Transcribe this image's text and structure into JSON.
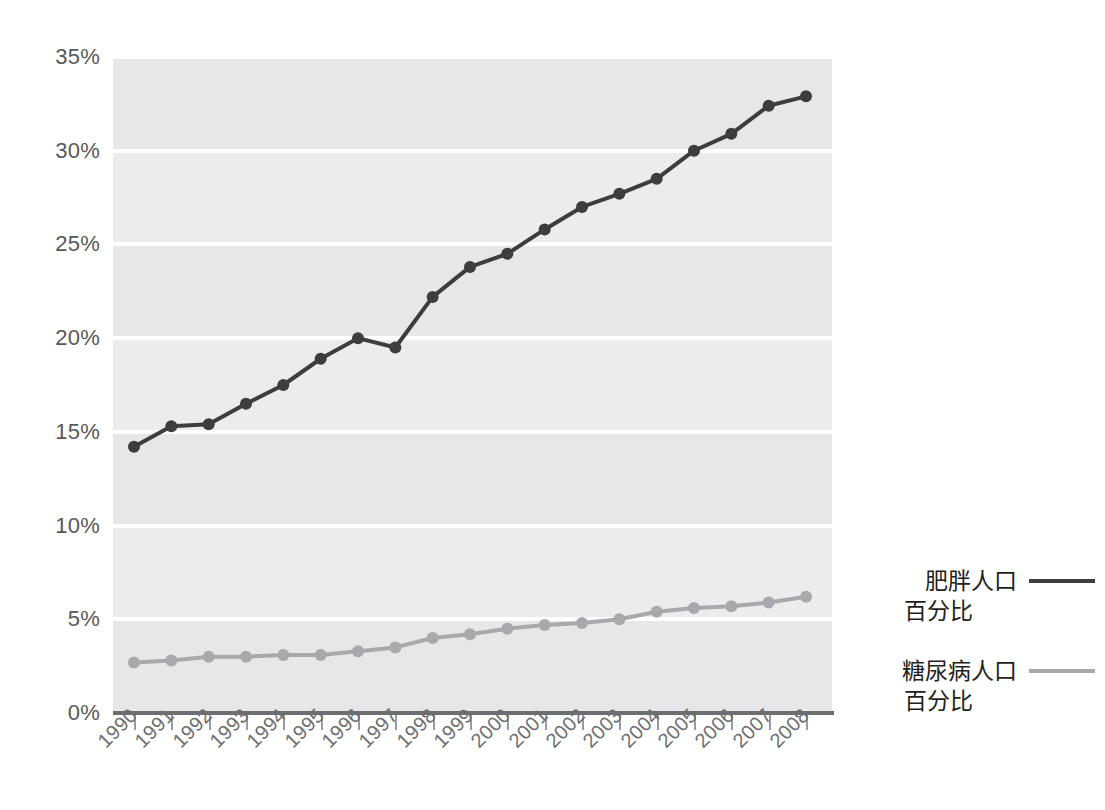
{
  "chart_data": {
    "type": "line",
    "title": "",
    "xlabel": "",
    "ylabel": "",
    "categories": [
      "1990",
      "1991",
      "1992",
      "1993",
      "1994",
      "1995",
      "1996",
      "1997",
      "1998",
      "1999",
      "2000",
      "2001",
      "2002",
      "2003",
      "2004",
      "2005",
      "2006",
      "2007",
      "2008"
    ],
    "ylim": [
      0,
      35
    ],
    "ytick_labels": [
      "0%",
      "5%",
      "10%",
      "15%",
      "20%",
      "25%",
      "30%",
      "35%"
    ],
    "ytick_values": [
      0,
      5,
      10,
      15,
      20,
      25,
      30,
      35
    ],
    "grid": true,
    "grid_style": "alternating horizontal bands with white gridlines",
    "legend_position": "right",
    "series": [
      {
        "name": "肥胖人口\n百分比",
        "name_line1": "肥胖人口",
        "name_line2": "百分比",
        "color": "#3d3d3f",
        "marker": "circle",
        "values": [
          14.2,
          15.3,
          15.4,
          16.5,
          17.5,
          18.9,
          20.0,
          19.5,
          22.2,
          23.8,
          24.5,
          25.8,
          27.0,
          27.7,
          28.5,
          30.0,
          30.9,
          32.4,
          32.9
        ]
      },
      {
        "name": "糖尿病人口\n百分比",
        "name_line1": "糖尿病人口",
        "name_line2": "百分比",
        "color": "#a7a9ac",
        "marker": "circle",
        "values": [
          2.7,
          2.8,
          3.0,
          3.0,
          3.1,
          3.1,
          3.3,
          3.5,
          4.0,
          4.2,
          4.5,
          4.7,
          4.8,
          5.0,
          5.4,
          5.6,
          5.7,
          5.9,
          6.2
        ]
      }
    ]
  },
  "legend": {
    "entries": [
      {
        "line1": "肥胖人口",
        "line2": "百分比",
        "color": "#3d3d3f"
      },
      {
        "line1": "糖尿病人口",
        "line2": "百分比",
        "color": "#a7a9ac"
      }
    ]
  },
  "colors": {
    "plot_background": "#e6e7e8",
    "band_light": "#ececed",
    "gridline": "#ffffff",
    "axis": "#6d6e71",
    "tick_label": "#6d6e71",
    "y_label": "#58585a",
    "obesity_line": "#3d3d3f",
    "diabetes_line": "#a7a9ac",
    "page_background": "#ffffff"
  }
}
